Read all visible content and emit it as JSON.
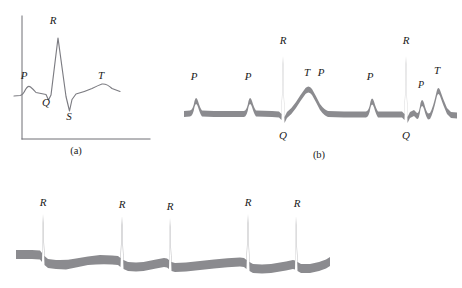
{
  "figure": {
    "background_color": "#ffffff",
    "trace_color_thin": "#7c7c82",
    "trace_color_thick": "#8b8b8f",
    "axis_color": "#6e6e74",
    "label_color": "#1a1a1a"
  },
  "panel_a": {
    "caption": "(a)",
    "description": "Normal single ECG complex with labeled P, Q, R, S and T deflections drawn as a thin line on a pair of axes.",
    "labels": [
      {
        "text": "P",
        "x": 24,
        "y": 79
      },
      {
        "text": "R",
        "x": 53,
        "y": 24
      },
      {
        "text": "Q",
        "x": 46,
        "y": 106
      },
      {
        "text": "S",
        "x": 69,
        "y": 120
      },
      {
        "text": "T",
        "x": 101,
        "y": 79
      }
    ],
    "caption_pos": {
      "x": 76,
      "y": 154
    },
    "axis": {
      "y_axis_x": 22,
      "y_axis_top": 16,
      "y_axis_bottom": 139,
      "x_axis_left": 22,
      "x_axis_right": 150,
      "x_axis_y": 139
    },
    "waveform_points": "14,96 20,95 25,90 30,87 35,92 41,93 46,94 48,99 51,94 53,78 56,58 58,38 61,56 64,76 66,96 69,110 71,100 74,94 80,93 88,90 95,87 101,84 106,86 112,90 120,91"
  },
  "panel_b": {
    "caption": "(b)",
    "description": "Atrial flutter / block rhythm strip drawn as a thick gray band with several P waves between QRS complexes.",
    "labels": [
      {
        "text": "P",
        "x": 194,
        "y": 80
      },
      {
        "text": "P",
        "x": 248,
        "y": 80
      },
      {
        "text": "R",
        "x": 283,
        "y": 44
      },
      {
        "text": "Q",
        "x": 283,
        "y": 139
      },
      {
        "text": "T",
        "x": 307,
        "y": 76
      },
      {
        "text": "P",
        "x": 321,
        "y": 76
      },
      {
        "text": "P",
        "x": 370,
        "y": 80
      },
      {
        "text": "R",
        "x": 406,
        "y": 44
      },
      {
        "text": "Q",
        "x": 406,
        "y": 139
      },
      {
        "text": "P",
        "x": 421,
        "y": 88
      },
      {
        "text": "T",
        "x": 437,
        "y": 74
      }
    ],
    "caption_pos": {
      "x": 319,
      "y": 158
    },
    "baseline_y": 114,
    "band_thickness": 6
  },
  "panel_c": {
    "caption": "",
    "description": "Atrial fibrillation rhythm strip: irregularly spaced tall R spikes on an undulating thick gray baseline with no discernible P waves.",
    "labels": [
      {
        "text": "R",
        "x": 43,
        "y": 206
      },
      {
        "text": "R",
        "x": 122,
        "y": 208
      },
      {
        "text": "R",
        "x": 170,
        "y": 210
      },
      {
        "text": "R",
        "x": 248,
        "y": 206
      },
      {
        "text": "R",
        "x": 297,
        "y": 207
      },
      {
        "text": "",
        "x": 0,
        "y": 0
      }
    ],
    "spike_x_positions": [
      43,
      122,
      170,
      248,
      297
    ],
    "baseline_y": 258,
    "band_thickness": 9,
    "trace_start_x": 16,
    "trace_end_x": 330
  }
}
